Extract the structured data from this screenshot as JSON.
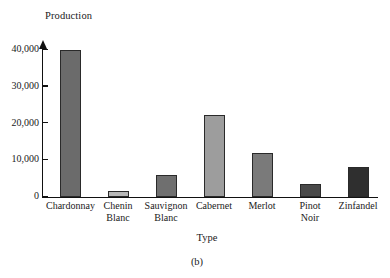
{
  "chart_data": {
    "type": "bar",
    "title": "",
    "subtitle": "",
    "xlabel": "Type",
    "ylabel": "Production",
    "ylim": [
      0,
      42500
    ],
    "grid": false,
    "legend": null,
    "caption": "(b)",
    "y_ticks": [
      {
        "value": 0,
        "label": "0"
      },
      {
        "value": 10000,
        "label": "10,000"
      },
      {
        "value": 20000,
        "label": "20,000"
      },
      {
        "value": 30000,
        "label": "30,000"
      },
      {
        "value": 40000,
        "label": "40,000"
      }
    ],
    "categories": [
      "Chardonnay",
      "Chenin Blanc",
      "Sauvignon Blanc",
      "Cabernet",
      "Merlot",
      "Pinot Noir",
      "Zinfandel"
    ],
    "category_lines": [
      [
        "Chardonnay",
        ""
      ],
      [
        "Chenin",
        "Blanc"
      ],
      [
        "Sauvignon",
        "Blanc"
      ],
      [
        "Cabernet",
        ""
      ],
      [
        "Merlot",
        ""
      ],
      [
        "Pinot",
        "Noir"
      ],
      [
        "Zinfandel",
        ""
      ]
    ],
    "values": [
      40000,
      1500,
      6000,
      22200,
      11800,
      3500,
      8200
    ],
    "colors": [
      "#6b6b6b",
      "#b7b7b7",
      "#6f6f6f",
      "#9d9d9d",
      "#7a7a7a",
      "#494949",
      "#2f2f2f"
    ]
  }
}
